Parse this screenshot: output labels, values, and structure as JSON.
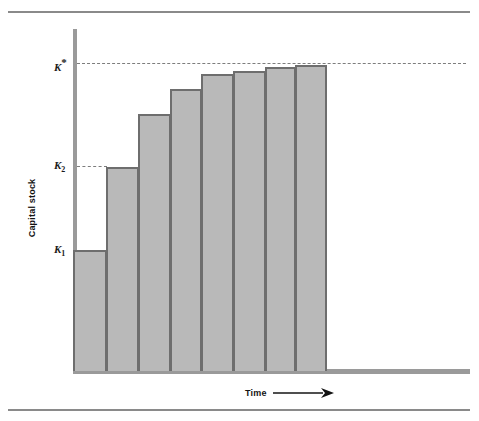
{
  "figure": {
    "name": "capital-stock-adjustment-over-time",
    "background": "#ffffff",
    "bar_fill": "#b9b9b9",
    "bar_stroke": "#6e6e6e",
    "axis_color": "#9a9a9a",
    "rule_color": "#8a8a8a",
    "dash_color": "#7d7d7d"
  },
  "chart_data": {
    "type": "bar",
    "title": "",
    "xlabel": "Time",
    "ylabel": "Capital stock",
    "grid": false,
    "legend": null,
    "categories": [
      "1",
      "2",
      "3",
      "4",
      "5",
      "6",
      "7",
      "8"
    ],
    "values": [
      117,
      201,
      255,
      280,
      295,
      298,
      302,
      304
    ],
    "ylim": [
      0,
      340
    ],
    "xlim": [
      0,
      8
    ],
    "annotations": [
      {
        "name": "k-star",
        "label": "K*",
        "label_html": "K<sup>*</sup>",
        "value": 307,
        "y_px": 63,
        "dashed_line": true,
        "line_from_px": 77,
        "line_to_px": 466
      },
      {
        "name": "k-2",
        "label": "K2",
        "label_html": "K<sub>2</sub>",
        "value": 201,
        "y_px": 166,
        "dashed_line": true,
        "line_from_px": 77,
        "line_to_px": 107
      },
      {
        "name": "k-1",
        "label": "K1",
        "label_html": "K<sub>1</sub>",
        "value": 117,
        "y_px": 250,
        "dashed_line": false,
        "line_from_px": 77,
        "line_to_px": 77
      }
    ],
    "bars_px": [
      {
        "index": 1,
        "left": 73,
        "width": 34,
        "top": 250
      },
      {
        "index": 2,
        "left": 106,
        "width": 33,
        "top": 167
      },
      {
        "index": 3,
        "left": 138,
        "width": 33,
        "top": 114
      },
      {
        "index": 4,
        "left": 170,
        "width": 32,
        "top": 89
      },
      {
        "index": 5,
        "left": 201,
        "width": 33,
        "top": 74
      },
      {
        "index": 6,
        "left": 233,
        "width": 33,
        "top": 71
      },
      {
        "index": 7,
        "left": 265,
        "width": 31,
        "top": 67
      },
      {
        "index": 8,
        "left": 295,
        "width": 32,
        "top": 65
      }
    ],
    "baseline_px": 371
  },
  "axes": {
    "y_title": "Capital stock",
    "x_title": "Time"
  }
}
